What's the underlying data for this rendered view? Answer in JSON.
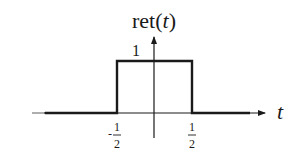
{
  "diagram": {
    "title_func": "ret(",
    "title_var": "t",
    "title_close": ")",
    "height_label": "1",
    "x_axis_label": "t",
    "left_tick": {
      "sign": "-",
      "numerator": "1",
      "denominator": "2"
    },
    "right_tick": {
      "numerator": "1",
      "denominator": "2"
    },
    "colors": {
      "line": "#1a1a1a",
      "background": "#ffffff"
    }
  }
}
